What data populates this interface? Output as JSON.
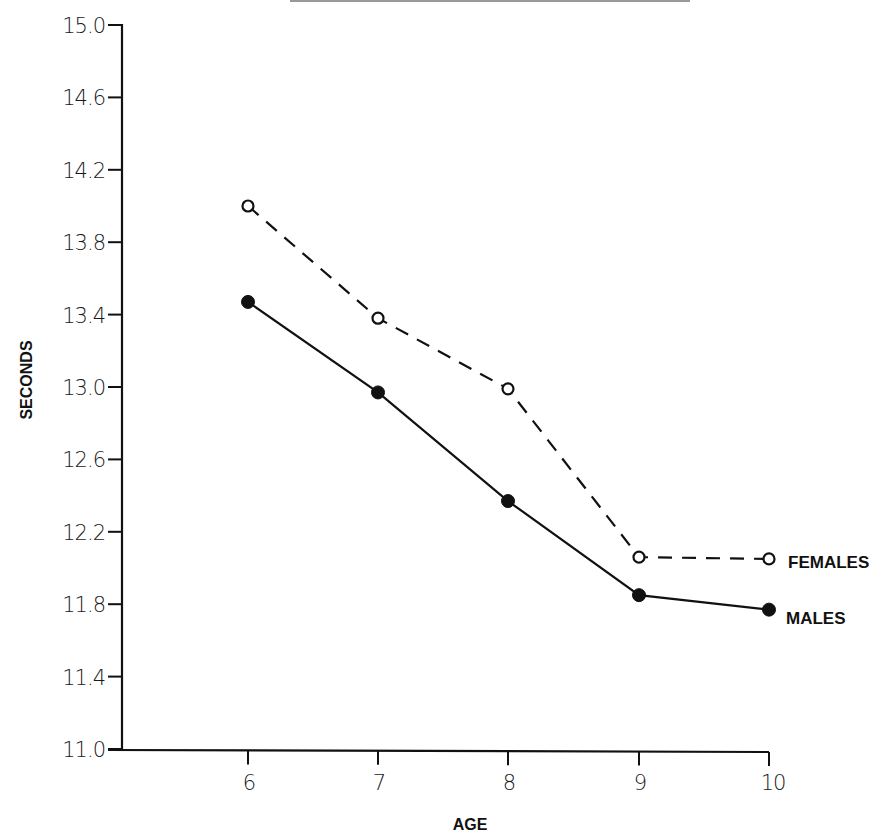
{
  "chart_data": {
    "type": "line",
    "title": "",
    "xlabel": "AGE",
    "ylabel": "SECONDS",
    "x": [
      6,
      7,
      8,
      9,
      10
    ],
    "x_tick_labels": [
      "6",
      "7",
      "8",
      "9",
      "10"
    ],
    "y_tick_labels": [
      "15.0",
      "14.6",
      "14.2",
      "13.8",
      "13.4",
      "13.0",
      "12.6",
      "12.2",
      "11.8",
      "11.4",
      "11.0"
    ],
    "y_ticks": [
      15.0,
      14.6,
      14.2,
      13.8,
      13.4,
      13.0,
      12.6,
      12.2,
      11.8,
      11.4,
      11.0
    ],
    "ylim": [
      11.0,
      15.0
    ],
    "xlim": [
      5,
      10
    ],
    "grid": false,
    "legend_position": "inline-right",
    "series": [
      {
        "name": "FEMALES",
        "marker": "open-circle",
        "line_style": "dashed",
        "values": [
          14.0,
          13.38,
          12.99,
          12.06,
          12.05
        ]
      },
      {
        "name": "MALES",
        "marker": "filled-circle",
        "line_style": "solid",
        "values": [
          13.47,
          12.97,
          12.37,
          11.85,
          11.77
        ]
      }
    ]
  },
  "labels": {
    "x_axis_title": "AGE",
    "y_axis_title": "SECONDS",
    "females": "FEMALES",
    "males": "MALES"
  }
}
